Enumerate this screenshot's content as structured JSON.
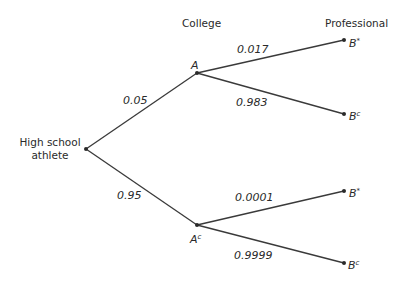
{
  "headers": {
    "college": "College",
    "professional": "Professional"
  },
  "root": {
    "line1": "High school",
    "line2": "athlete"
  },
  "nodes": {
    "A": {
      "base": "A",
      "sup": ""
    },
    "Ac": {
      "base": "A",
      "sup": "c"
    },
    "B1": {
      "base": "B",
      "sup": "*"
    },
    "B1c": {
      "base": "B",
      "sup": "c"
    },
    "B2": {
      "base": "B",
      "sup": "*"
    },
    "B2c": {
      "base": "B",
      "sup": "c"
    }
  },
  "edges": {
    "root_A": "0.05",
    "root_Ac": "0.95",
    "A_B": "0.017",
    "A_Bc": "0.983",
    "Ac_B": "0.0001",
    "Ac_Bc": "0.9999"
  },
  "colors": {
    "line": "#3a3a3a",
    "text": "#2a2a2a",
    "background": "#ffffff"
  }
}
